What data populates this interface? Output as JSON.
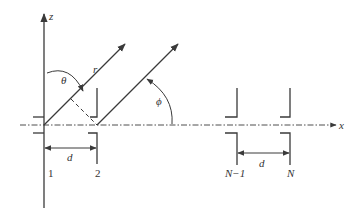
{
  "diagram": {
    "type": "linear antenna array geometry",
    "axes": {
      "z_label": "z",
      "x_label": "x"
    },
    "angles": {
      "theta_label": "θ",
      "phi_label": "ϕ"
    },
    "ray_label": "r",
    "spacing_label": "d",
    "elements": [
      {
        "label": "1"
      },
      {
        "label": "2"
      },
      {
        "label": "N−1"
      },
      {
        "label": "N"
      }
    ],
    "colors": {
      "line": "#3a3a3a",
      "background": "#ffffff"
    }
  }
}
